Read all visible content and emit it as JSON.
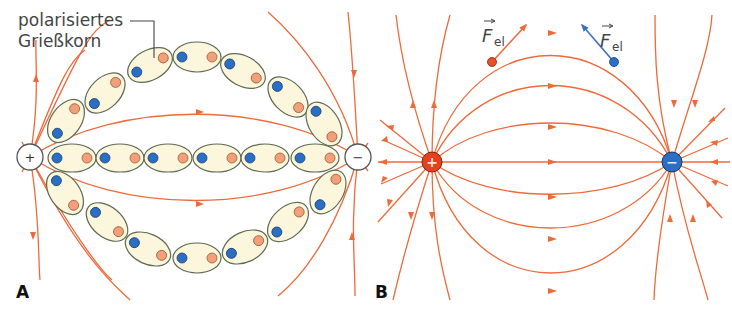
{
  "figure": {
    "panel_a": {
      "label": "A",
      "annotation_line1": "polarisiertes",
      "annotation_line2": "Grießkorn",
      "positive_electrode_sign": "+",
      "negative_electrode_sign": "−",
      "grain_count_top_arc": 7,
      "grain_count_middle_row": 6,
      "grain_count_bottom_arc": 7
    },
    "panel_b": {
      "label": "B",
      "positive_charge_sign": "+",
      "negative_charge_sign": "−",
      "force_label_left_main": "F",
      "force_label_left_sub": "el",
      "force_label_right_main": "F",
      "force_label_right_sub": "el"
    },
    "colors": {
      "field_line": "#ef6a3a",
      "grain_fill": "#fbf6dc",
      "grain_stroke": "#5f6b52",
      "negative_pole": "#2a6fc4",
      "positive_pole_small": "#f2a07a",
      "positive_charge_b": "#e8401c",
      "negative_charge_b": "#2a6fc4",
      "force_arrow_negative": "#3a70c0",
      "text": "#333333"
    }
  }
}
